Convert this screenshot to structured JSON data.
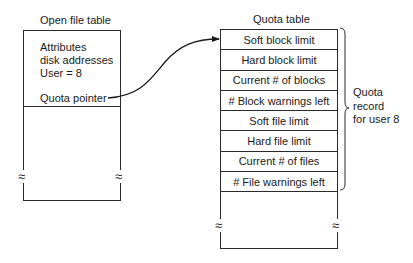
{
  "open_file_table": {
    "title": "Open file table",
    "lines": [
      "Attributes",
      "disk addresses",
      "User = 8"
    ],
    "pointer_label": "Quota pointer",
    "break_symbol": "≈"
  },
  "quota_table": {
    "title": "Quota table",
    "rows": [
      "Soft block limit",
      "Hard block limit",
      "Current # of blocks",
      "# Block warnings left",
      "Soft file limit",
      "Hard file limit",
      "Current # of files",
      "# File warnings left"
    ],
    "break_symbol": "≈"
  },
  "brace": {
    "lines": [
      "Quota",
      "record",
      "for user 8"
    ]
  },
  "arrow": {
    "from": "open_file_table.pointer_label",
    "to": "quota_table.rows.0"
  }
}
